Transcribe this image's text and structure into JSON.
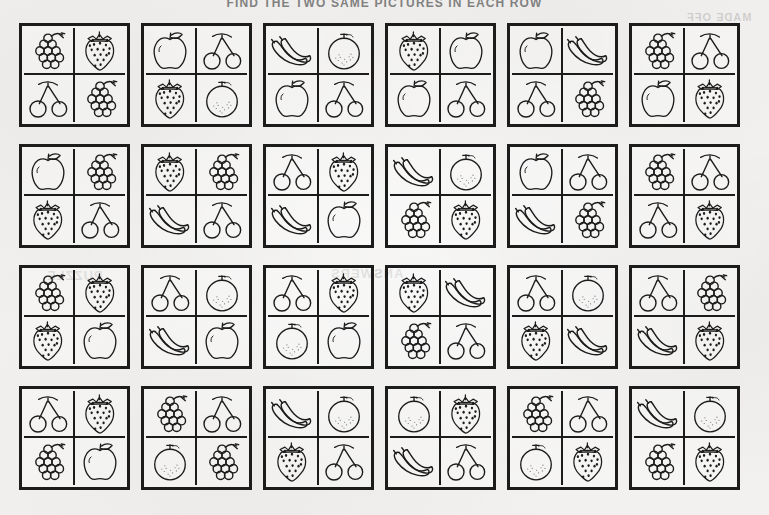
{
  "page": {
    "title": "FIND THE TWO SAME PICTURES IN EACH ROW",
    "background_color": "#f2f1ef",
    "ink_color": "#1c1c1c",
    "reverse_bleed_text_1": "MADE OFF",
    "reverse_bleed_text_2": "PUZZLE",
    "reverse_bleed_text_3": "ANSWERS",
    "columns": 6,
    "rows": 4
  },
  "fruit_names": {
    "grapes": "grapes",
    "strawberry": "strawberry",
    "cherries": "cherries",
    "apple": "apple",
    "orange": "orange",
    "banana": "banana"
  },
  "grid": [
    [
      {
        "id": "r1c1",
        "cells": [
          "grapes",
          "strawberry",
          "cherries",
          "grapes"
        ]
      },
      {
        "id": "r1c2",
        "cells": [
          "apple",
          "cherries",
          "strawberry",
          "orange"
        ]
      },
      {
        "id": "r1c3",
        "cells": [
          "banana",
          "orange",
          "apple",
          "cherries"
        ]
      },
      {
        "id": "r1c4",
        "cells": [
          "strawberry",
          "apple",
          "apple",
          "cherries"
        ]
      },
      {
        "id": "r1c5",
        "cells": [
          "apple",
          "banana",
          "cherries",
          "grapes"
        ]
      },
      {
        "id": "r1c6",
        "cells": [
          "grapes",
          "cherries",
          "apple",
          "strawberry"
        ]
      }
    ],
    [
      {
        "id": "r2c1",
        "cells": [
          "apple",
          "grapes",
          "strawberry",
          "cherries"
        ]
      },
      {
        "id": "r2c2",
        "cells": [
          "strawberry",
          "grapes",
          "banana",
          "cherries"
        ]
      },
      {
        "id": "r2c3",
        "cells": [
          "cherries",
          "strawberry",
          "banana",
          "apple"
        ]
      },
      {
        "id": "r2c4",
        "cells": [
          "banana",
          "orange",
          "grapes",
          "strawberry"
        ]
      },
      {
        "id": "r2c5",
        "cells": [
          "apple",
          "cherries",
          "banana",
          "grapes"
        ]
      },
      {
        "id": "r2c6",
        "cells": [
          "grapes",
          "cherries",
          "cherries",
          "strawberry"
        ]
      }
    ],
    [
      {
        "id": "r3c1",
        "cells": [
          "grapes",
          "strawberry",
          "strawberry",
          "apple"
        ]
      },
      {
        "id": "r3c2",
        "cells": [
          "cherries",
          "orange",
          "banana",
          "apple"
        ]
      },
      {
        "id": "r3c3",
        "cells": [
          "cherries",
          "strawberry",
          "orange",
          "apple"
        ]
      },
      {
        "id": "r3c4",
        "cells": [
          "strawberry",
          "banana",
          "grapes",
          "cherries"
        ]
      },
      {
        "id": "r3c5",
        "cells": [
          "cherries",
          "orange",
          "strawberry",
          "banana"
        ]
      },
      {
        "id": "r3c6",
        "cells": [
          "cherries",
          "grapes",
          "banana",
          "strawberry"
        ]
      }
    ],
    [
      {
        "id": "r4c1",
        "cells": [
          "cherries",
          "strawberry",
          "grapes",
          "apple"
        ]
      },
      {
        "id": "r4c2",
        "cells": [
          "grapes",
          "cherries",
          "orange",
          "grapes"
        ]
      },
      {
        "id": "r4c3",
        "cells": [
          "banana",
          "orange",
          "strawberry",
          "cherries"
        ]
      },
      {
        "id": "r4c4",
        "cells": [
          "orange",
          "strawberry",
          "banana",
          "cherries"
        ]
      },
      {
        "id": "r4c5",
        "cells": [
          "grapes",
          "cherries",
          "orange",
          "strawberry"
        ]
      },
      {
        "id": "r4c6",
        "cells": [
          "banana",
          "orange",
          "grapes",
          "strawberry"
        ]
      }
    ]
  ]
}
